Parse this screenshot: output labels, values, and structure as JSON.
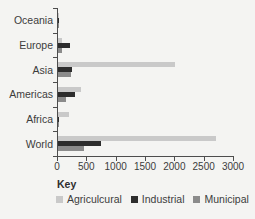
{
  "page": {
    "background": "#f4f4f2",
    "axis_color": "#4d4d4d",
    "text_color": "#3c3c3c"
  },
  "chart_data": {
    "type": "bar",
    "orientation": "horizontal",
    "title": "",
    "xlabel": "",
    "ylabel": "",
    "categories": [
      "Oceania",
      "Europe",
      "Asia",
      "Americas",
      "Africa",
      "World"
    ],
    "series": [
      {
        "name": "Agriculcural",
        "color": "#c9c9c9",
        "values": [
          19,
          75,
          2000,
          390,
          185,
          2700
        ]
      },
      {
        "name": "Industrial",
        "color": "#2d2d2d",
        "values": [
          3,
          210,
          240,
          290,
          15,
          730
        ]
      },
      {
        "name": "Municipal",
        "color": "#8b8b8b",
        "values": [
          5,
          65,
          230,
          130,
          25,
          440
        ]
      }
    ],
    "xlim": [
      0,
      3000
    ],
    "x_ticks": [
      "0",
      "500",
      "1000",
      "1500",
      "2000",
      "2500",
      "3000"
    ],
    "grid": false,
    "legend_title": "Key",
    "legend_position": "bottom"
  }
}
